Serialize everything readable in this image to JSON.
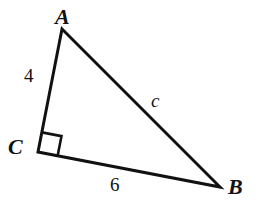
{
  "figure": {
    "kind": "right-triangle-diagram",
    "background_color": "#ffffff",
    "stroke_color": "#111111",
    "stroke_width": 3,
    "width": 260,
    "height": 205,
    "vertices": {
      "A": {
        "label": "A",
        "x": 62,
        "y": 29
      },
      "B": {
        "label": "B",
        "x": 220,
        "y": 187
      },
      "C": {
        "label": "C",
        "x": 38,
        "y": 152
      }
    },
    "sides": [
      {
        "name": "leg-AC",
        "label": "4",
        "from": "A",
        "to": "C"
      },
      {
        "name": "leg-CB",
        "label": "6",
        "from": "C",
        "to": "B"
      },
      {
        "name": "hypotenuse-AB",
        "label": "c",
        "from": "A",
        "to": "B"
      }
    ],
    "right_angle": {
      "at_vertex": "C",
      "marker": "square",
      "size": 20
    },
    "paths": {
      "triangle": "M 62 29 L 38 152 L 220 187 Z",
      "right_angle_marker": "M 41.2 151.4 L 42.7 131.6 L 62.3 134.7 L 60.8 154.5"
    }
  }
}
